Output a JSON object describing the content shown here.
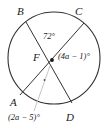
{
  "figure": {
    "type": "circle-with-intersecting-chords",
    "title": "",
    "center_label": "F",
    "points": [
      {
        "name": "B",
        "label": "B",
        "x": 26,
        "y": 22
      },
      {
        "name": "C",
        "label": "C",
        "x": 84,
        "y": 23
      },
      {
        "name": "A",
        "label": "A",
        "x": 20,
        "y": 95
      },
      {
        "name": "D",
        "label": "D",
        "x": 72,
        "y": 103
      },
      {
        "name": "F",
        "label": "F",
        "x": 52,
        "y": 60
      }
    ],
    "circle": {
      "cx": 54,
      "cy": 58,
      "r": 46,
      "stroke": "#333333"
    },
    "chords": [
      {
        "name": "chord-B-D",
        "from": "B",
        "to": "D"
      },
      {
        "name": "chord-C-A",
        "from": "C",
        "to": "A"
      }
    ],
    "leader": {
      "name": "leader-line-2a",
      "from_x": 50,
      "from_y": 66,
      "to_x": 36,
      "to_y": 110,
      "stroke": "#b9b9b9"
    },
    "angles": [
      {
        "name": "angle-BFC",
        "label": "72°",
        "value": 72,
        "unit": "degrees"
      },
      {
        "name": "angle-CFD",
        "label": "(4a − 1)°",
        "expression": "4a - 1",
        "unit": "degrees"
      },
      {
        "name": "angle-AFD",
        "label": "(2a − 5)°",
        "expression": "2a - 5",
        "unit": "degrees"
      }
    ],
    "colors": {
      "stroke": "#333333",
      "text": "#1a1a1a",
      "leader": "#b9b9b9",
      "background": "#ffffff"
    }
  }
}
